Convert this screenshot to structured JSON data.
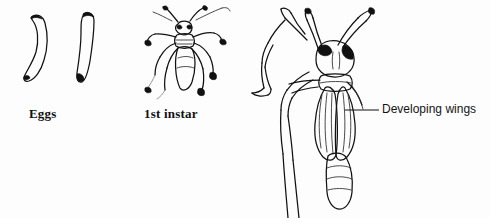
{
  "figure": {
    "kind": "entomological-line-illustration",
    "width": 490,
    "height": 218,
    "background_color": "#fdfdfd",
    "ink_color": "#111111"
  },
  "captions": {
    "eggs": "Eggs",
    "first_instar": "1st instar"
  },
  "callouts": {
    "developing_wings": {
      "label": "Developing wings",
      "leader_from_x": 345,
      "leader_to_x": 379,
      "leader_y": 110
    }
  },
  "specimens": [
    {
      "name": "egg-curved",
      "stage": "Eggs",
      "shape": "curved elongate outline"
    },
    {
      "name": "egg-straight",
      "stage": "Eggs",
      "shape": "straight elongate outline"
    },
    {
      "name": "first-instar-nymph",
      "stage": "1st instar",
      "features": [
        "antennae",
        "six legs",
        "segmented abdomen"
      ]
    },
    {
      "name": "late-instar-nymph",
      "stage": "later instar",
      "features": [
        "antennae",
        "dark eyes",
        "wing pads",
        "raised foreleg",
        "segmented abdomen"
      ]
    }
  ]
}
